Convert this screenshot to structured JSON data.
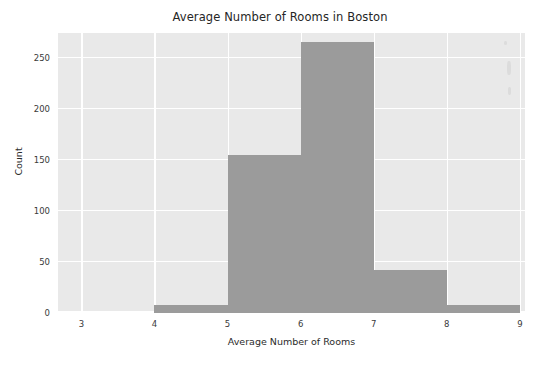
{
  "chart_data": {
    "type": "bar",
    "title": "Average Number of Rooms in Boston",
    "xlabel": "Average Number of Rooms",
    "ylabel": "Count",
    "categories": [
      "3-4",
      "4-5",
      "5-6",
      "6-7",
      "7-8",
      "8-9"
    ],
    "bin_edges": [
      3,
      4,
      5,
      6,
      7,
      8,
      9
    ],
    "values": [
      0,
      8,
      155,
      266,
      42,
      8
    ],
    "bars": [
      {
        "label": "3-4",
        "x0": 3,
        "x1": 4,
        "value": 0
      },
      {
        "label": "4-5",
        "x0": 4,
        "x1": 5,
        "value": 8
      },
      {
        "label": "5-6",
        "x0": 5,
        "x1": 6,
        "value": 155
      },
      {
        "label": "6-7",
        "x0": 6,
        "x1": 7,
        "value": 266
      },
      {
        "label": "7-8",
        "x0": 7,
        "x1": 8,
        "value": 42
      },
      {
        "label": "8-9",
        "x0": 8,
        "x1": 9,
        "value": 8
      }
    ],
    "xlim": [
      2.68,
      9.07
    ],
    "ylim": [
      0,
      275
    ],
    "xticks": [
      3,
      4,
      5,
      6,
      7,
      8,
      9
    ],
    "yticks": [
      0,
      50,
      100,
      150,
      200,
      250
    ],
    "xtick_labels": [
      "3",
      "4",
      "5",
      "6",
      "7",
      "8",
      "9"
    ],
    "ytick_labels": [
      "0",
      "50",
      "100",
      "150",
      "200",
      "250"
    ],
    "grid": true,
    "legend": null,
    "colors": {
      "bar": "#9b9b9b",
      "plot_background": "#e9e9e9",
      "gridline": "#ffffff",
      "figure_background": "#ffffff",
      "text": "#2b2b2b"
    }
  }
}
